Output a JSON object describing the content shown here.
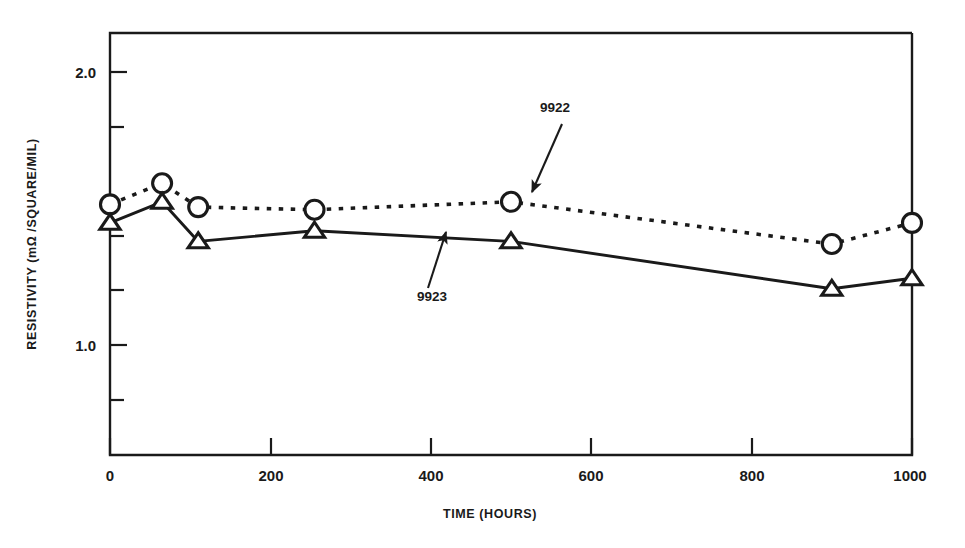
{
  "chart_data": {
    "type": "line",
    "title": "",
    "subtitle": "",
    "xlabel": "TIME (HOURS)",
    "ylabel": "RESISTIVITY (mΩ /SQUARE/MIL)",
    "xlim": [
      0,
      1000
    ],
    "ylim": [
      0.6,
      2.2
    ],
    "grid": false,
    "legend_position": "inline-annotations",
    "x_ticks_major": [
      0,
      200,
      400,
      600,
      800,
      1000
    ],
    "x_tick_labels": [
      "0",
      "200",
      "400",
      "600",
      "800",
      "1000"
    ],
    "y_ticks_labeled": [
      1.0,
      2.0
    ],
    "y_tick_labels": [
      "1.0",
      "2.0"
    ],
    "y_ticks_minor": [
      0.8,
      1.2,
      1.4,
      1.6,
      1.8
    ],
    "series": [
      {
        "name": "9922",
        "marker": "circle-open",
        "linestyle": "dotted",
        "color": "#1a1a1a",
        "x": [
          0,
          65,
          110,
          255,
          500,
          900,
          1000
        ],
        "values": [
          1.55,
          1.63,
          1.54,
          1.53,
          1.56,
          1.4,
          1.48
        ]
      },
      {
        "name": "9923",
        "marker": "triangle-open",
        "linestyle": "solid",
        "color": "#1a1a1a",
        "x": [
          0,
          65,
          110,
          255,
          500,
          900,
          1000
        ],
        "values": [
          1.48,
          1.56,
          1.41,
          1.45,
          1.41,
          1.23,
          1.27
        ]
      }
    ],
    "annotations": [
      {
        "text": "9922",
        "label_x": 555,
        "label_y": 112,
        "arrow_from_x": 562,
        "arrow_from_y": 124,
        "arrow_to_x": 532,
        "arrow_to_y": 192
      },
      {
        "text": "9923",
        "label_x": 432,
        "label_y": 301,
        "arrow_from_x": 428,
        "arrow_from_y": 288,
        "arrow_to_x": 446,
        "arrow_to_y": 232
      }
    ]
  },
  "axes": {
    "x_tick_labels": [
      "0",
      "200",
      "400",
      "600",
      "800",
      "1000"
    ],
    "y_tick_labels": {
      "upper": "2.0",
      "lower": "1.0"
    },
    "x_axis_title": "TIME (HOURS)",
    "y_axis_title": "RESISTIVITY (mΩ /SQUARE/MIL)"
  },
  "series_labels": {
    "s9922": "9922",
    "s9923": "9923"
  }
}
